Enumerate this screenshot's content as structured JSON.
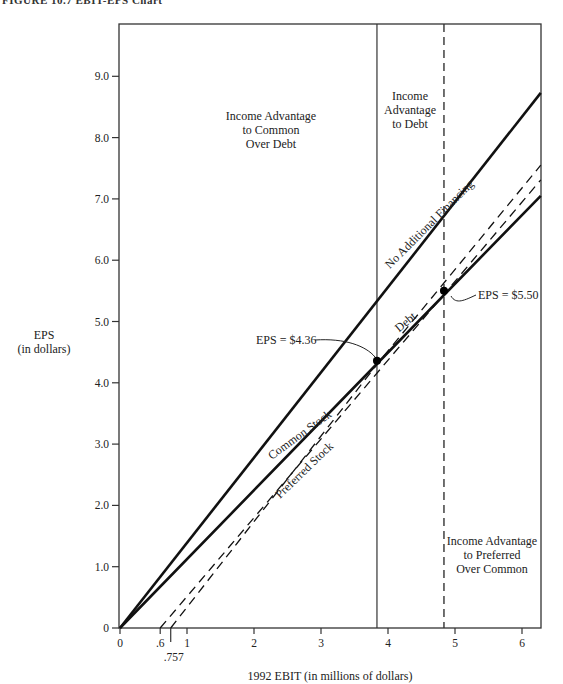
{
  "figure_title": "FIGURE 10.7  EBIT-EPS Chart",
  "chart_data": {
    "type": "line",
    "title": "EBIT-EPS Chart",
    "xlabel": "1992 EBIT (in millions of dollars)",
    "ylabel": "EPS",
    "ylabel_sub": "(in dollars)",
    "xlim": [
      0,
      6.3
    ],
    "ylim": [
      0,
      9.9
    ],
    "grid": false,
    "x_ticks": [
      "0",
      ".6",
      "1",
      "2",
      "3",
      "4",
      "5",
      "6"
    ],
    "x_tick_values": [
      0,
      0.6,
      1,
      2,
      3,
      4,
      5,
      6
    ],
    "x_extra_tick": {
      "value": 0.757,
      "label": ".757"
    },
    "y_ticks": [
      "0",
      "1.0",
      "2.0",
      "3.0",
      "4.0",
      "5.0",
      "6.0",
      "7.0",
      "8.0",
      "9.0"
    ],
    "y_tick_values": [
      0,
      1,
      2,
      3,
      4,
      5,
      6,
      7,
      8,
      9
    ],
    "series": [
      {
        "name": "No Additional Financing",
        "style": "solid",
        "x": [
          0,
          6.28
        ],
        "y": [
          0,
          8.73
        ]
      },
      {
        "name": "Common Stock",
        "style": "solid",
        "x": [
          0,
          3.88,
          6.28
        ],
        "y": [
          0,
          4.36,
          7.05
        ]
      },
      {
        "name": "Debt",
        "style": "dashed",
        "x": [
          0.757,
          3.88,
          6.28
        ],
        "y": [
          0,
          4.36,
          7.55
        ]
      },
      {
        "name": "Preferred Stock",
        "style": "dashed",
        "x": [
          0.6,
          4.88,
          6.28
        ],
        "y": [
          0,
          5.5,
          7.31
        ]
      }
    ],
    "vertical_lines": [
      {
        "x": 3.88,
        "style": "solid"
      },
      {
        "x": 4.88,
        "style": "dashed"
      }
    ],
    "points": [
      {
        "x": 3.88,
        "y": 4.36,
        "label": "EPS = $4.36"
      },
      {
        "x": 4.88,
        "y": 5.5,
        "label": "EPS = $5.50"
      }
    ],
    "regions": [
      {
        "lines": [
          "Income Advantage",
          "to Common",
          "Over Debt"
        ]
      },
      {
        "lines": [
          "Income",
          "Advantage",
          "to Debt"
        ]
      },
      {
        "lines": [
          "Income Advantage",
          "to Preferred",
          "Over Common"
        ]
      }
    ]
  }
}
